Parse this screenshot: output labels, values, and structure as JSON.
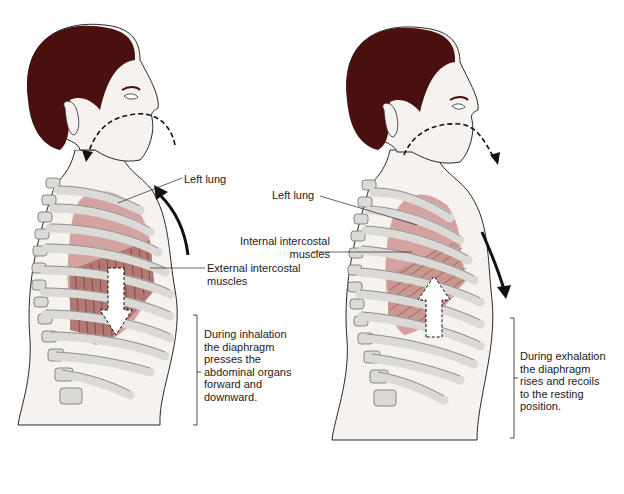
{
  "figure": {
    "panels": [
      {
        "id": "inhalation",
        "labels": {
          "left_lung": "Left  lung",
          "external_intercostal": "External intercostal\nmuscles"
        },
        "caption": "During inhalation\nthe diaphragm\npresses the\nabdominal organs\nforward and\ndownward.",
        "airflow": "into nose, down to trachea",
        "diaphragm_arrow": "down",
        "chest_arrow": "up"
      },
      {
        "id": "exhalation",
        "labels": {
          "left_lung": "Left  lung",
          "internal_intercostal": "Internal intercostal\nmuscles"
        },
        "caption": "During exhalation\nthe diaphragm\nrises and recoils\nto the resting\nposition.",
        "airflow": "out of nose",
        "diaphragm_arrow": "up",
        "chest_arrow": "down"
      }
    ]
  },
  "colors": {
    "hair": "#4a0f0f",
    "skin": "#f5f2ef",
    "outline": "#2a2a2a",
    "bone": "#dcdad6",
    "bone_outline": "#6e6e6e",
    "lung": "#d4a3a1",
    "muscle": "#b27873",
    "arrow": "#111111"
  }
}
